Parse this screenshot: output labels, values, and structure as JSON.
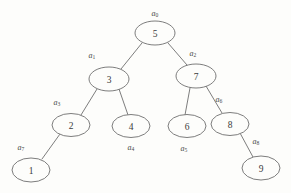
{
  "figure": {
    "kind": "binary-search-tree-diagram",
    "background_color": "#fdfdfb",
    "stroke_color": "#6e6e6e",
    "text_color": "#3a3a3a",
    "width": 291,
    "height": 193
  },
  "nodes": [
    {
      "id": "n0",
      "value": "5",
      "label": "a",
      "subscript": "0",
      "cx": 155,
      "cy": 33,
      "rx": 20,
      "ry": 12,
      "label_x": 155,
      "label_y": 13
    },
    {
      "id": "n1",
      "value": "3",
      "label": "a",
      "subscript": "1",
      "cx": 109,
      "cy": 79,
      "rx": 20,
      "ry": 12,
      "label_x": 92,
      "label_y": 55
    },
    {
      "id": "n2",
      "value": "7",
      "label": "a",
      "subscript": "2",
      "cx": 196,
      "cy": 76,
      "rx": 20,
      "ry": 12,
      "label_x": 193,
      "label_y": 53
    },
    {
      "id": "n3",
      "value": "2",
      "label": "a",
      "subscript": "3",
      "cx": 71,
      "cy": 125,
      "rx": 19,
      "ry": 11.5,
      "label_x": 57,
      "label_y": 102
    },
    {
      "id": "n4",
      "value": "4",
      "label": "a",
      "subscript": "4",
      "cx": 131,
      "cy": 126,
      "rx": 19,
      "ry": 11.5,
      "label_x": 131,
      "label_y": 147
    },
    {
      "id": "n5",
      "value": "6",
      "label": "a",
      "subscript": "5",
      "cx": 187,
      "cy": 126,
      "rx": 19,
      "ry": 11.5,
      "label_x": 184,
      "label_y": 148
    },
    {
      "id": "n6",
      "value": "8",
      "label": "a",
      "subscript": "6",
      "cx": 230,
      "cy": 124,
      "rx": 19,
      "ry": 11.5,
      "label_x": 219,
      "label_y": 99
    },
    {
      "id": "n7",
      "value": "1",
      "label": "a",
      "subscript": "7",
      "cx": 31,
      "cy": 170,
      "rx": 19,
      "ry": 12,
      "label_x": 21,
      "label_y": 147
    },
    {
      "id": "n8",
      "value": "9",
      "label": "a",
      "subscript": "8",
      "cx": 261,
      "cy": 168,
      "rx": 19,
      "ry": 12,
      "label_x": 256,
      "label_y": 141
    }
  ],
  "edges": [
    {
      "id": "e0",
      "from": "n0",
      "to": "n1",
      "x1": 142,
      "y1": 43,
      "x2": 121,
      "y2": 69
    },
    {
      "id": "e1",
      "from": "n0",
      "to": "n2",
      "x1": 168,
      "y1": 43,
      "x2": 187,
      "y2": 65
    },
    {
      "id": "e2",
      "from": "n1",
      "to": "n3",
      "x1": 97,
      "y1": 89,
      "x2": 81,
      "y2": 115
    },
    {
      "id": "e3",
      "from": "n1",
      "to": "n4",
      "x1": 119,
      "y1": 89,
      "x2": 128,
      "y2": 115
    },
    {
      "id": "e4",
      "from": "n2",
      "to": "n5",
      "x1": 190,
      "y1": 88,
      "x2": 185,
      "y2": 115
    },
    {
      "id": "e5",
      "from": "n2",
      "to": "n6",
      "x1": 206,
      "y1": 86,
      "x2": 222,
      "y2": 113
    },
    {
      "id": "e6",
      "from": "n3",
      "to": "n7",
      "x1": 60,
      "y1": 134,
      "x2": 42,
      "y2": 159
    },
    {
      "id": "e7",
      "from": "n6",
      "to": "n8",
      "x1": 240,
      "y1": 133,
      "x2": 253,
      "y2": 157
    }
  ]
}
